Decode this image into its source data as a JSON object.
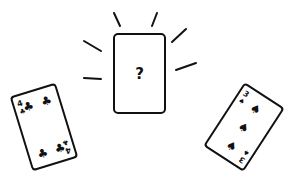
{
  "scene": {
    "description": "Line-art illustration of three playing cards",
    "colors": {
      "ink": "#111111",
      "paper": "#ffffff"
    }
  },
  "cards": [
    {
      "position": "left",
      "rank": "4",
      "suit": "clubs",
      "suit_glyph": "♣",
      "rotation_deg": -17
    },
    {
      "position": "center",
      "rank": "",
      "suit": "hidden",
      "face_label": "?",
      "rotation_deg": 0,
      "highlight": "radiating-lines"
    },
    {
      "position": "right",
      "rank": "3",
      "suit": "spades",
      "suit_glyph": "♠",
      "rotation_deg": 33
    }
  ]
}
